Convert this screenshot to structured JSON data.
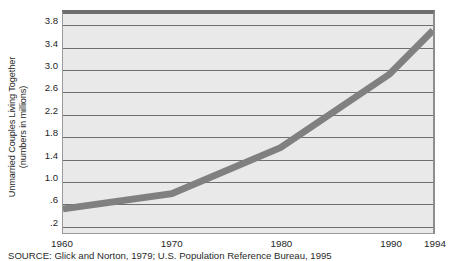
{
  "chart_data": {
    "type": "line",
    "title": "",
    "xlabel": "",
    "ylabel": "Unmarried Couples Living Together (numbers in millions)",
    "ylabel_line1": "Unmarried Couples Living Together",
    "ylabel_line2": "(numbers in millions)",
    "categories": [
      "1960",
      "1970",
      "1980",
      "1990",
      "1994"
    ],
    "x": [
      1960,
      1970,
      1980,
      1990,
      1994
    ],
    "values": [
      0.44,
      0.72,
      1.56,
      2.9,
      3.7
    ],
    "series": [
      {
        "name": "Unmarried Couples Living Together",
        "values": [
          0.44,
          0.72,
          1.56,
          2.9,
          3.7
        ],
        "color": "#808080"
      }
    ],
    "ylim": [
      0.0,
      4.0
    ],
    "xlim": [
      1960,
      1994
    ],
    "y_ticks": [
      3.8,
      3.4,
      3.0,
      2.6,
      2.2,
      1.8,
      1.4,
      1.0,
      0.6,
      0.2
    ],
    "y_tick_labels": [
      "3.8",
      "3.4",
      "3.0",
      "2.6",
      "2.2",
      "1.8",
      "1.4",
      "1.0",
      ".6",
      ".2"
    ],
    "x_ticks": [
      1960,
      1970,
      1980,
      1990,
      1994
    ],
    "x_tick_labels": [
      "1960",
      "1970",
      "1980",
      "1990",
      "1994"
    ],
    "grid": true,
    "grid_axis": "y",
    "legend": false,
    "legend_position": "none",
    "plot_background_color": "#e9e9e9",
    "gridline_color": "#6f6f6f",
    "line_color": "#808080",
    "line_width_px": 7,
    "annotations": []
  },
  "figure": {
    "source_note": "SOURCE: Glick and Norton, 1979; U.S. Population Reference Bureau, 1995"
  }
}
